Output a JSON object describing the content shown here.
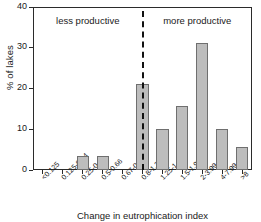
{
  "chart_data": {
    "type": "bar",
    "title": "",
    "xlabel": "Change in eutrophication index",
    "ylabel": "% of lakes",
    "ylim": [
      0,
      40
    ],
    "yticks": [
      "0",
      "10",
      "20",
      "30",
      "40"
    ],
    "ytick_values": [
      0,
      10,
      20,
      30,
      40
    ],
    "grid": false,
    "legend": null,
    "categories": [
      "<0.125",
      "0.125-0.24",
      "0.25-0.49",
      "0.5-0.66",
      "0.67-0.79",
      "0.8-1.24",
      "1.25-1.49",
      "1.5-1.99",
      "2-3.99",
      "4-7.99",
      ">8"
    ],
    "values": [
      0,
      0,
      3.4,
      3.4,
      0,
      21.2,
      10.1,
      15.6,
      31.1,
      10.1,
      5.7
    ],
    "bar_color": "#bdbdbd",
    "bar_edge_color": "#6f6f6f",
    "annotations": [
      {
        "text": "less productive",
        "position": "left-of-divider"
      },
      {
        "text": "more productive",
        "position": "right-of-divider"
      }
    ],
    "divider": {
      "at_category": "0.8-1.24",
      "style": "dashed",
      "color": "#111111"
    }
  }
}
